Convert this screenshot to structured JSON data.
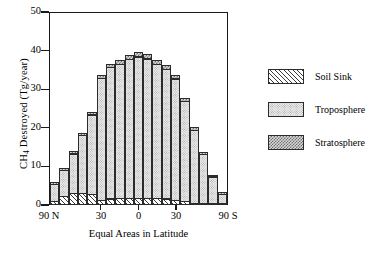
{
  "chart_data": {
    "type": "bar",
    "title": "",
    "subtitle": "",
    "xlabel": "Equal Areas in Latitude",
    "ylabel": "CH4 Destroyed (Tg/year)",
    "ylabel_prefix": "CH",
    "ylabel_sub": "4",
    "ylabel_suffix": " Destroyed (Tg/year)",
    "ylim": [
      0,
      50
    ],
    "yticks": [
      0,
      10,
      20,
      30,
      40,
      50
    ],
    "ytick_labels": [
      "0",
      "10",
      "20",
      "30",
      "40",
      "50"
    ],
    "xtick_labels": [
      "90 N",
      "30",
      "0",
      "30",
      "90 S"
    ],
    "xtick_fractions": [
      0.0,
      0.29,
      0.5,
      0.71,
      1.0
    ],
    "grid": false,
    "stacked": true,
    "legend_position": "right",
    "categories": [
      "1",
      "2",
      "3",
      "4",
      "5",
      "6",
      "7",
      "8",
      "9",
      "10",
      "11",
      "12",
      "13",
      "14",
      "15",
      "16",
      "17",
      "18",
      "19"
    ],
    "series": [
      {
        "name": "Soil Sink",
        "pattern": "diagonal-hatch",
        "color": "#ffffff",
        "values": [
          1.0,
          2.2,
          3.1,
          3.0,
          2.7,
          1.2,
          1.6,
          1.7,
          1.7,
          1.7,
          1.7,
          1.7,
          1.6,
          1.3,
          0.9,
          0.5,
          0.2,
          0.1,
          0.1
        ]
      },
      {
        "name": "Troposphere",
        "pattern": "fine-dots",
        "color": "#e9e9e9",
        "values": [
          4.6,
          7.1,
          10.4,
          15.2,
          20.9,
          31.8,
          34.3,
          35.0,
          36.3,
          36.9,
          36.4,
          34.9,
          33.8,
          31.6,
          26.2,
          19.1,
          12.9,
          7.0,
          2.5
        ]
      },
      {
        "name": "Stratosphere",
        "pattern": "cross-hatch",
        "color": "#d8d8d8",
        "values": [
          0.7,
          0.7,
          0.8,
          0.8,
          0.9,
          1.0,
          1.1,
          1.2,
          1.2,
          1.4,
          1.4,
          1.4,
          1.2,
          1.1,
          1.0,
          0.9,
          0.8,
          0.7,
          0.6
        ]
      }
    ],
    "totals": [
      6.3,
      10.0,
      14.3,
      19.0,
      24.5,
      34.0,
      37.0,
      37.9,
      39.2,
      40.0,
      39.5,
      38.0,
      36.6,
      34.0,
      28.1,
      20.5,
      13.9,
      7.8,
      3.2
    ]
  },
  "legend": {
    "items": [
      {
        "label": "Soil Sink"
      },
      {
        "label": "Troposphere"
      },
      {
        "label": "Stratosphere"
      }
    ]
  }
}
